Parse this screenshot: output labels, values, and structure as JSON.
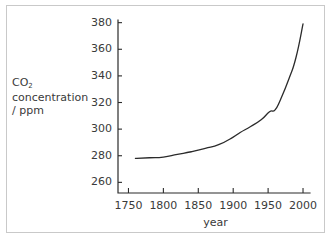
{
  "chart_data": {
    "type": "line",
    "title": "",
    "xlabel": "year",
    "ylabel_lines": [
      "CO",
      "2",
      " concentration",
      "/ ppm"
    ],
    "ylabel_text": "CO2 concentration / ppm",
    "ylabel_line1_main": "CO",
    "ylabel_line1_sub": "2",
    "ylabel_line2": "concentration",
    "ylabel_line3": "/ ppm",
    "xlim": [
      1735,
      2010
    ],
    "ylim": [
      252,
      382
    ],
    "xticks": [
      1750,
      1800,
      1850,
      1900,
      1950,
      2000
    ],
    "xtick_labels": [
      "1750",
      "1800",
      "1850",
      "1900",
      "1950",
      "2000"
    ],
    "yticks": [
      260,
      280,
      300,
      320,
      340,
      360,
      380
    ],
    "ytick_labels": [
      "260",
      "280",
      "300",
      "320",
      "340",
      "360",
      "380"
    ],
    "grid": false,
    "legend": null,
    "series": [
      {
        "name": "CO2 concentration",
        "x": [
          1760,
          1780,
          1800,
          1820,
          1840,
          1860,
          1880,
          1900,
          1910,
          1925,
          1940,
          1952,
          1960,
          1968,
          1980,
          1990,
          2000
        ],
        "y": [
          278,
          278.5,
          279,
          281,
          283,
          285.5,
          288.5,
          294,
          297.5,
          302,
          307,
          313,
          314.5,
          322.5,
          338,
          354,
          379
        ]
      }
    ],
    "line_color": "#2b2b2b",
    "line_width": 1.3,
    "axis_color": "#2b2b2b",
    "frame_color": "#c9c9c9",
    "background": "#ffffff",
    "text_color": "#3a3a3a"
  },
  "axis_layout": {
    "plot_left_px": 118,
    "plot_right_px": 310,
    "plot_top_px": 20,
    "plot_bottom_px": 193
  }
}
